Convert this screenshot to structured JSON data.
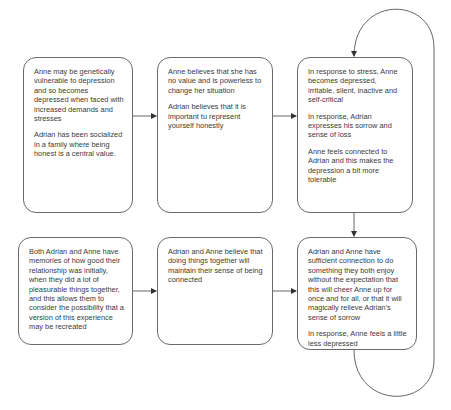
{
  "diagram": {
    "type": "flowchart",
    "line_color": "#555555",
    "box_border_color": "#6a6a6a",
    "text_color": "#3a3a3a",
    "boxes": [
      {
        "id": "box1",
        "paragraphs": [
          "Anne  may be genetically vulnerable to depression and so becomes depressed when faced with increased demands and stresses",
          "Adrian has been socialized in a family where being honest is a central value."
        ]
      },
      {
        "id": "box2",
        "paragraphs": [
          "Anne believes that she has no value and is powerless to change her situation",
          "Adrian believes that it is important tu represent yourself honestly"
        ]
      },
      {
        "id": "box3",
        "paragraphs": [
          "In response to stress, Anne becomes depressed, irritable, silent, inactive and self-critical",
          "In response, Adrian expresses his sorrow and sense of loss",
          "Anne feels connected to Adrian and this makes the depression a bit more tolerable"
        ]
      },
      {
        "id": "box4",
        "paragraphs": [
          "Both Adrian and Anne have memories of how good their relationship was initially, when they did a lot of pleasurable things together, and this allows them to consider the possibility that a version of this experience may be recreated"
        ]
      },
      {
        "id": "box5",
        "paragraphs": [
          "Adrian and Anne believe that doing things together will maintain their sense of being connected"
        ]
      },
      {
        "id": "box6",
        "paragraphs": [
          "Adrian and Anne have sufficient connection to do something they both enjoy without the expectation that this will cheer Anne up for once and for all, or that it will magically relieve Adrian's sense of sorrow",
          "In response, Anne feels a little less depressed"
        ]
      }
    ],
    "edges": [
      {
        "from": "box1",
        "to": "box2"
      },
      {
        "from": "box2",
        "to": "box3"
      },
      {
        "from": "box3",
        "to": "box6"
      },
      {
        "from": "box4",
        "to": "box5"
      },
      {
        "from": "box5",
        "to": "box6"
      },
      {
        "from": "box6",
        "to": "box3",
        "style": "loop-around-right"
      }
    ]
  }
}
